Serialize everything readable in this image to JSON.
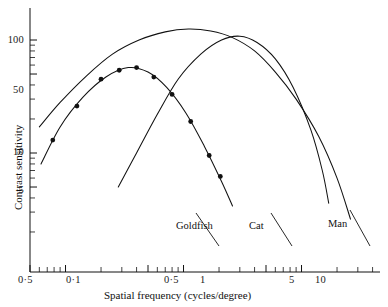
{
  "figure": {
    "background": "#ffffff",
    "ink": "#111111"
  },
  "chart_data": {
    "type": "line",
    "title": "",
    "xlabel": "Spatial frequency (cycles/degree)",
    "ylabel": "Contrast sensitivity",
    "xscale": "log",
    "yscale": "log",
    "xlim": [
      0.04,
      60
    ],
    "ylim": [
      1.6,
      300
    ],
    "grid": false,
    "legend_position": "inline-labels",
    "xticks_labeled": [
      {
        "value": 0.05,
        "label": "0·5"
      },
      {
        "value": 0.1,
        "label": "0·1"
      },
      {
        "value": 0.5,
        "label": "0·5"
      },
      {
        "value": 1,
        "label": "1"
      },
      {
        "value": 5,
        "label": "5"
      },
      {
        "value": 10,
        "label": "10"
      }
    ],
    "yticks_labeled": [
      {
        "value": 100,
        "label": "100"
      },
      {
        "value": 50,
        "label": "50"
      },
      {
        "value": 10,
        "label": "10"
      },
      {
        "value": 5,
        "label": "5"
      }
    ],
    "yticks_minor": [
      2,
      3,
      4,
      6,
      7,
      8,
      9,
      20,
      30,
      40,
      60,
      70,
      80,
      90,
      200,
      300
    ],
    "xticks_minor": [
      0.06,
      0.07,
      0.08,
      0.09,
      0.2,
      0.3,
      0.4,
      0.6,
      0.7,
      0.8,
      0.9,
      2,
      3,
      4,
      6,
      7,
      8,
      9,
      20,
      30,
      40,
      50
    ],
    "series": [
      {
        "name": "Goldfish",
        "label": "Goldfish",
        "has_markers": true,
        "marker": "filled-circle",
        "points": [
          {
            "x": 0.078,
            "y": 13.0
          },
          {
            "x": 0.125,
            "y": 26.0
          },
          {
            "x": 0.2,
            "y": 45.0
          },
          {
            "x": 0.285,
            "y": 54.0
          },
          {
            "x": 0.4,
            "y": 57.0
          },
          {
            "x": 0.56,
            "y": 47.0
          },
          {
            "x": 0.8,
            "y": 33.0
          },
          {
            "x": 1.15,
            "y": 19.0
          },
          {
            "x": 1.65,
            "y": 9.5
          },
          {
            "x": 2.05,
            "y": 6.2
          }
        ],
        "curve": [
          {
            "x": 0.062,
            "y": 8.0
          },
          {
            "x": 0.09,
            "y": 17.0
          },
          {
            "x": 0.14,
            "y": 31.0
          },
          {
            "x": 0.22,
            "y": 47.0
          },
          {
            "x": 0.34,
            "y": 57.0
          },
          {
            "x": 0.5,
            "y": 52.0
          },
          {
            "x": 0.72,
            "y": 38.0
          },
          {
            "x": 1.05,
            "y": 22.5
          },
          {
            "x": 1.5,
            "y": 11.5
          },
          {
            "x": 2.1,
            "y": 5.6
          },
          {
            "x": 2.6,
            "y": 3.4
          }
        ]
      },
      {
        "name": "Cat",
        "label": "Cat",
        "has_markers": false,
        "curve": [
          {
            "x": 0.28,
            "y": 5.0
          },
          {
            "x": 0.4,
            "y": 10.0
          },
          {
            "x": 0.6,
            "y": 22.0
          },
          {
            "x": 0.9,
            "y": 45.0
          },
          {
            "x": 1.4,
            "y": 75.0
          },
          {
            "x": 2.1,
            "y": 100.0
          },
          {
            "x": 3.0,
            "y": 108.0
          },
          {
            "x": 4.2,
            "y": 95.0
          },
          {
            "x": 6.0,
            "y": 68.0
          },
          {
            "x": 8.5,
            "y": 38.0
          },
          {
            "x": 12.0,
            "y": 16.0
          },
          {
            "x": 15.0,
            "y": 7.0
          },
          {
            "x": 17.0,
            "y": 3.6
          }
        ]
      },
      {
        "name": "Man",
        "label": "Man",
        "has_markers": false,
        "curve": [
          {
            "x": 0.06,
            "y": 17.0
          },
          {
            "x": 0.09,
            "y": 28.0
          },
          {
            "x": 0.15,
            "y": 48.0
          },
          {
            "x": 0.25,
            "y": 75.0
          },
          {
            "x": 0.42,
            "y": 100.0
          },
          {
            "x": 0.7,
            "y": 118.0
          },
          {
            "x": 1.1,
            "y": 125.0
          },
          {
            "x": 1.7,
            "y": 120.0
          },
          {
            "x": 2.6,
            "y": 105.0
          },
          {
            "x": 4.0,
            "y": 80.0
          },
          {
            "x": 6.0,
            "y": 52.0
          },
          {
            "x": 9.0,
            "y": 30.0
          },
          {
            "x": 14.0,
            "y": 14.0
          },
          {
            "x": 20.0,
            "y": 6.0
          },
          {
            "x": 26.0,
            "y": 2.6
          }
        ]
      }
    ],
    "annotations": [
      {
        "text": "Goldfish",
        "for": "Goldfish"
      },
      {
        "text": "Cat",
        "for": "Cat"
      },
      {
        "text": "Man",
        "for": "Man"
      }
    ]
  },
  "labels": {
    "x_axis": "Spatial frequency (cycles/degree)",
    "y_axis": "Contrast sensitivity",
    "goldfish": "Goldfish",
    "cat": "Cat",
    "man": "Man",
    "y_100": "100",
    "y_50": "50",
    "y_10": "10",
    "y_5": "5",
    "x_005": "0·5",
    "x_01": "0·1",
    "x_05": "0·5",
    "x_1": "1",
    "x_5": "5",
    "x_10": "10"
  }
}
